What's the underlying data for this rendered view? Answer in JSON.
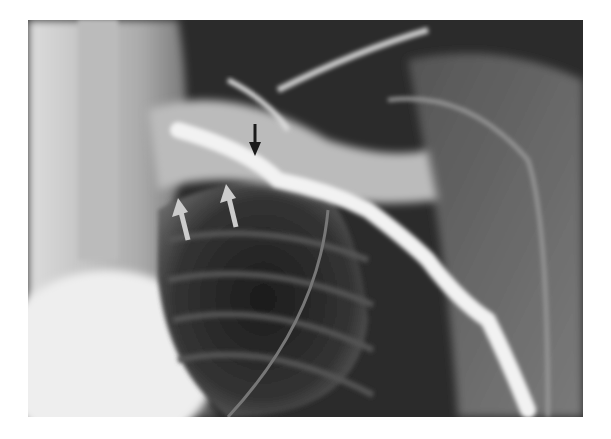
{
  "image": {
    "subject": "chest radiograph / venogram of right shoulder region",
    "annotations": [
      {
        "type": "arrow",
        "color": "#1a1a1a",
        "direction": "down",
        "label": ""
      },
      {
        "type": "arrow",
        "color": "#cccccc",
        "direction": "up",
        "label": ""
      },
      {
        "type": "arrow",
        "color": "#cccccc",
        "direction": "up",
        "label": ""
      }
    ]
  }
}
